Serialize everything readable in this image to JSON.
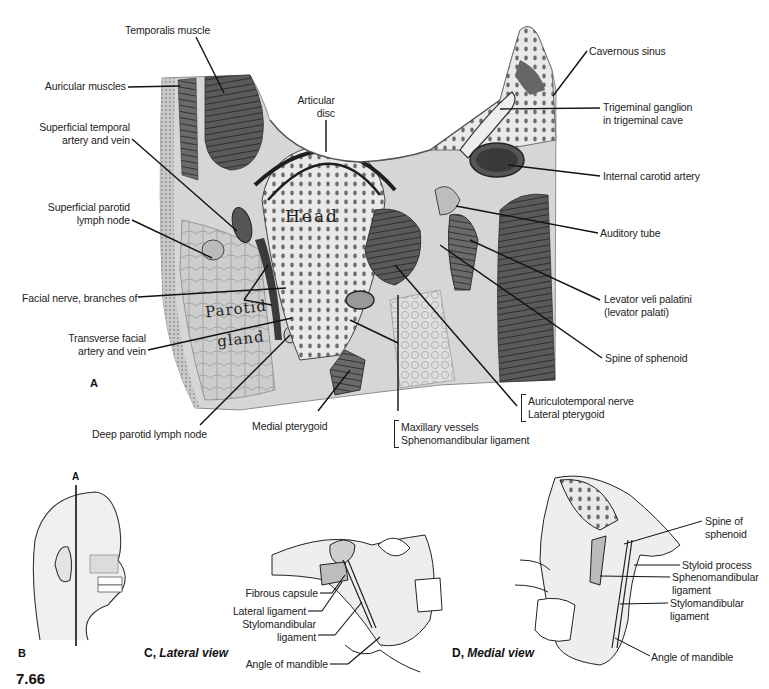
{
  "figure": {
    "number": "7.66",
    "panels": {
      "A": {
        "letter": "A",
        "labels": {
          "temporalis": "Temporalis muscle",
          "auricular": "Auricular muscles",
          "sup_temp_1": "Superficial temporal",
          "sup_temp_2": "artery and vein",
          "sup_parotid_1": "Superficial parotid",
          "sup_parotid_2": "lymph node",
          "facial_nerve": "Facial nerve, branches of",
          "trans_facial_1": "Transverse facial",
          "trans_facial_2": "artery and vein",
          "deep_parotid": "Deep parotid lymph node",
          "medial_pterygoid": "Medial pterygoid",
          "maxillary": "Maxillary vessels",
          "sphenomandibular": "Sphenomandibular ligament",
          "auriculotemporal": "Auriculotemporal nerve",
          "lateral_pterygoid": "Lateral pterygoid",
          "articular_1": "Articular",
          "articular_2": "disc",
          "cavernous": "Cavernous sinus",
          "trigeminal_1": "Trigeminal ganglion",
          "trigeminal_2": "in trigeminal cave",
          "int_carotid": "Internal carotid artery",
          "auditory": "Auditory tube",
          "levator_1": "Levator veli palatini",
          "levator_2": "(levator palati)",
          "spine_sphenoid": "Spine of sphenoid"
        },
        "in_image_text": {
          "head": "Head",
          "parotid": "Parotid",
          "gland": "gland"
        }
      },
      "B": {
        "letter": "B",
        "section_marker": "A"
      },
      "C": {
        "letter": "C",
        "title": "Lateral view",
        "labels": {
          "fibrous_capsule": "Fibrous capsule",
          "lateral_ligament": "Lateral ligament",
          "stylomandibular_1": "Stylomandibular",
          "stylomandibular_2": "ligament",
          "angle": "Angle of mandible"
        }
      },
      "D": {
        "letter": "D",
        "title": "Medial view",
        "labels": {
          "spine_1": "Spine of",
          "spine_2": "sphenoid",
          "styloid": "Styloid process",
          "spheno_1": "Sphenomandibular",
          "spheno_2": "ligament",
          "stylo_1": "Stylomandibular",
          "stylo_2": "ligament",
          "angle": "Angle of mandible"
        }
      }
    },
    "colors": {
      "tissue_light": "#d9d9d9",
      "tissue_mid": "#a8a8a8",
      "muscle_dark": "#4a4a4a",
      "bone": "#e6e6e6",
      "line": "#1a1a1a"
    }
  }
}
